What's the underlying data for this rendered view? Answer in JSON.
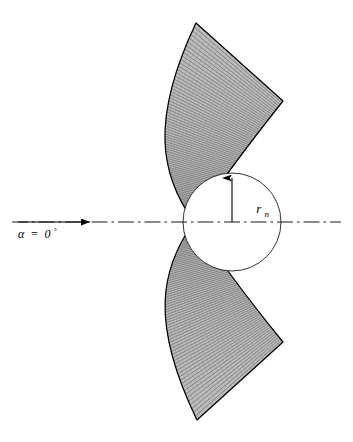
{
  "figure": {
    "name": "blunt-wedge-radial-grid-diagram",
    "background_color": "#ffffff",
    "line_color": "#000000",
    "hatch_color": "#555555",
    "fill_color": "#b9b9b9"
  },
  "labels": {
    "angle_of_attack": {
      "symbol": "α",
      "equals": "=",
      "value": "0",
      "degree": "°",
      "full": "α = 0°"
    },
    "nose_radius": {
      "symbol": "r",
      "subscript": "n",
      "full": "rₙ"
    }
  },
  "geometry": {
    "centerline_y": 222,
    "centerline_x_start": 12,
    "centerline_x_end": 341,
    "flow_arrow_x_start": 18,
    "flow_arrow_x_end": 92,
    "circle_center_x": 232,
    "circle_center_y": 222,
    "circle_radius": 49,
    "radius_arrow_from_y": 222,
    "radius_arrow_to_y": 174,
    "apex_x": 194,
    "apex_y": 222,
    "wedge_top_tip_x": 196,
    "wedge_top_tip_y": 23,
    "wedge_top_outer_x": 283,
    "wedge_top_outer_y": 101,
    "wedge_bottom_tip_x": 197,
    "wedge_bottom_tip_y": 420,
    "wedge_bottom_outer_x": 283,
    "wedge_bottom_outer_y": 342,
    "leading_edge_left_x": 138,
    "grid_line_count": 76
  },
  "chart_data": {
    "type": "diagram",
    "title": "",
    "annotations": [
      "α = 0°",
      "rₙ"
    ]
  }
}
